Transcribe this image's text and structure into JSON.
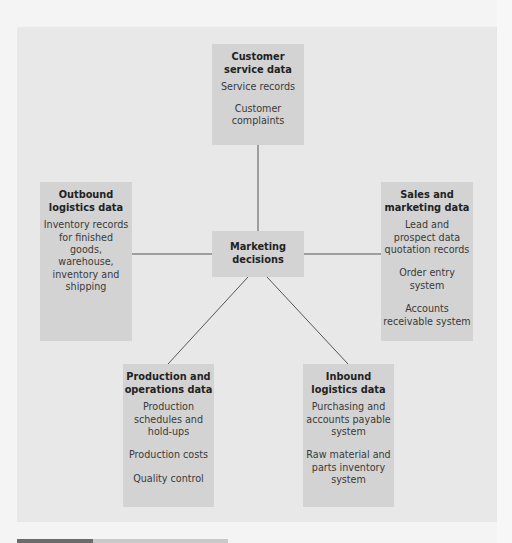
{
  "diagram": {
    "center": {
      "title": "Marketing\ndecisions"
    },
    "nodes": {
      "customer_service": {
        "title": "Customer\nservice data",
        "items": [
          "Service records",
          "Customer\ncomplaints"
        ]
      },
      "outbound_logistics": {
        "title": "Outbound\nlogistics data",
        "items": [
          "Inventory records\nfor finished\ngoods,\nwarehouse,\ninventory and\nshipping"
        ]
      },
      "sales_marketing": {
        "title": "Sales and\nmarketing data",
        "items": [
          "Lead and\nprospect data\nquotation records",
          "Order entry\nsystem",
          "Accounts\nreceivable system"
        ]
      },
      "production_operations": {
        "title": "Production and\noperations data",
        "items": [
          "Production\nschedules and\nhold-ups",
          "Production costs",
          "Quality control"
        ]
      },
      "inbound_logistics": {
        "title": "Inbound\nlogistics data",
        "items": [
          "Purchasing and\naccounts payable\nsystem",
          "Raw material and\nparts inventory\nsystem"
        ]
      }
    },
    "colors": {
      "panel": "#e8e8e8",
      "box": "#d3d3d3",
      "line": "#555555",
      "bar_dark": "#6b6b6b",
      "bar_light": "#c9c9c9"
    }
  }
}
